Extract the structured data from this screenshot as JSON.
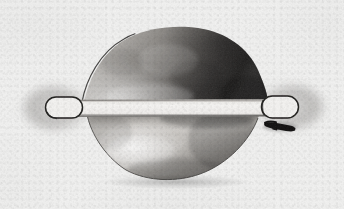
{
  "image": {
    "kind": "scanned-illustration",
    "title": "Lens-shaped body with two stadium-shaped end loops",
    "medium": "grayscale halftone scan on aged paper",
    "width_px": 344,
    "height_px": 209,
    "background_color": "#f2f2f1",
    "ink_color": "#1a1a1a",
    "paper_tone": "#efeeec"
  },
  "parts": [
    {
      "id": "upper-dome",
      "label": "Upper dome body",
      "description": "Large convex lens-shaped upper half, dark shaded toward the right",
      "bbox": [
        82,
        28,
        268,
        106
      ],
      "shade": "dark-right"
    },
    {
      "id": "lower-dome",
      "label": "Lower dome body",
      "description": "Shallower convex lower half, lighter with a dark band along its top edge",
      "bbox": [
        86,
        106,
        262,
        181
      ],
      "shade": "light-with-dark-top-band"
    },
    {
      "id": "center-band",
      "label": "Central horizontal band",
      "description": "Light horizontal strip spanning between the two end loops",
      "bbox": [
        60,
        99,
        288,
        117
      ],
      "shade": "light"
    },
    {
      "id": "left-loop",
      "label": "Left end loop",
      "description": "Stadium-shaped outline ring at the left terminus, surrounded by a soft gray halo",
      "bbox": [
        45,
        96,
        83,
        119
      ],
      "shade": "outline-with-halo"
    },
    {
      "id": "right-loop",
      "label": "Right end loop",
      "description": "Stadium-shaped outline ring at the right terminus, surrounded by a soft gray halo",
      "bbox": [
        261,
        95,
        299,
        119
      ],
      "shade": "outline-with-halo"
    },
    {
      "id": "left-halo",
      "label": "Left halo smudge",
      "description": "Diffuse gray oval smudge surrounding the left loop",
      "bbox": [
        18,
        84,
        90,
        132
      ]
    },
    {
      "id": "right-halo",
      "label": "Right halo smudge",
      "description": "Diffuse gray oval smudge surrounding the right loop",
      "bbox": [
        256,
        82,
        326,
        132
      ]
    },
    {
      "id": "black-mark",
      "label": "Black bracket mark",
      "description": "Small solid black angular clamp-like mark just below the right loop",
      "bbox": [
        263,
        122,
        296,
        134
      ],
      "shade": "solid-black"
    },
    {
      "id": "upper-left-contour",
      "label": "Upper left contour line",
      "description": "Thin dark curved outline sweeping from the left loop up to the dome crest",
      "bbox": [
        80,
        33,
        135,
        102
      ]
    }
  ],
  "caption": {
    "text": "",
    "visible": false
  }
}
